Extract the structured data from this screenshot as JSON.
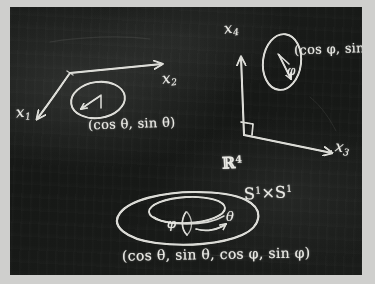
{
  "scene": {
    "medium": "chalkboard",
    "board_color": "#1a1c1a",
    "frame_color": "#cfcfcd",
    "chalk_color": "#e9e9e4"
  },
  "frame_left": {
    "axis_x1": {
      "label": "x",
      "sub": "1"
    },
    "axis_x2": {
      "label": "x",
      "sub": "2"
    },
    "circle_point": "(cos θ, sin θ)",
    "angle": "θ"
  },
  "frame_right": {
    "axis_x3": {
      "label": "x",
      "sub": "3"
    },
    "axis_x4": {
      "label": "x",
      "sub": "4"
    },
    "circle_point": "(cos φ, sin φ)",
    "angle": "φ",
    "right_angle_mark": "∟"
  },
  "torus": {
    "ambient_space": {
      "symbol": "ℝ",
      "sup": "4"
    },
    "product_space": {
      "s_first": "S",
      "sup_first": "1",
      "times": "×",
      "s_second": "S",
      "sup_second": "1"
    },
    "angle_phi": "φ",
    "angle_theta": "θ",
    "parametrization": "(cos θ, sin θ, cos φ, sin φ)"
  }
}
